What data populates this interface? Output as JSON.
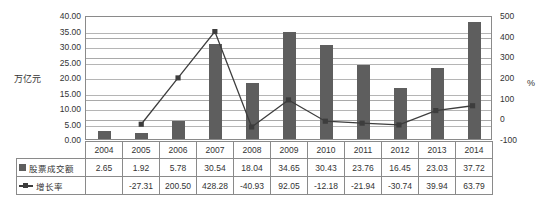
{
  "axis": {
    "left_unit": "万亿元",
    "right_unit": "%",
    "left_ticks": [
      "40.00",
      "35.00",
      "30.00",
      "25.00",
      "20.00",
      "15.00",
      "10.00",
      "5.00",
      "0.00"
    ],
    "right_ticks": [
      "500",
      "400",
      "300",
      "200",
      "100",
      "0",
      "-100"
    ]
  },
  "legend": {
    "bar_label": "股票成交额",
    "line_label": "增长率"
  },
  "chart_data": {
    "type": "bar",
    "title": "",
    "subtitle": "",
    "xlabel": "",
    "ylabel": "万亿元",
    "y2label": "%",
    "grid": true,
    "legend_position": "table-below",
    "categories": [
      "2004",
      "2005",
      "2006",
      "2007",
      "2008",
      "2009",
      "2010",
      "2011",
      "2012",
      "2013",
      "2014"
    ],
    "ylim": [
      0,
      40
    ],
    "y2lim": [
      -100,
      500
    ],
    "series": [
      {
        "name": "股票成交额",
        "type": "bar",
        "axis": "left",
        "unit": "万亿元",
        "color": "#5e5e5e",
        "values": [
          2.65,
          1.92,
          5.78,
          30.54,
          18.04,
          34.65,
          30.43,
          23.76,
          16.45,
          23.03,
          37.72
        ],
        "labels": [
          "2.65",
          "1.92",
          "5.78",
          "30.54",
          "18.04",
          "34.65",
          "30.43",
          "23.76",
          "16.45",
          "23.03",
          "37.72"
        ]
      },
      {
        "name": "增长率",
        "type": "line",
        "axis": "right",
        "unit": "%",
        "color": "#3d3d3d",
        "values": [
          null,
          -27.31,
          200.5,
          428.28,
          -40.93,
          92.05,
          -12.18,
          -21.94,
          -30.74,
          39.94,
          63.79
        ],
        "labels": [
          "",
          "-27.31",
          "200.50",
          "428.28",
          "-40.93",
          "92.05",
          "-12.18",
          "-21.94",
          "-30.74",
          "39.94",
          "63.79"
        ]
      }
    ]
  }
}
